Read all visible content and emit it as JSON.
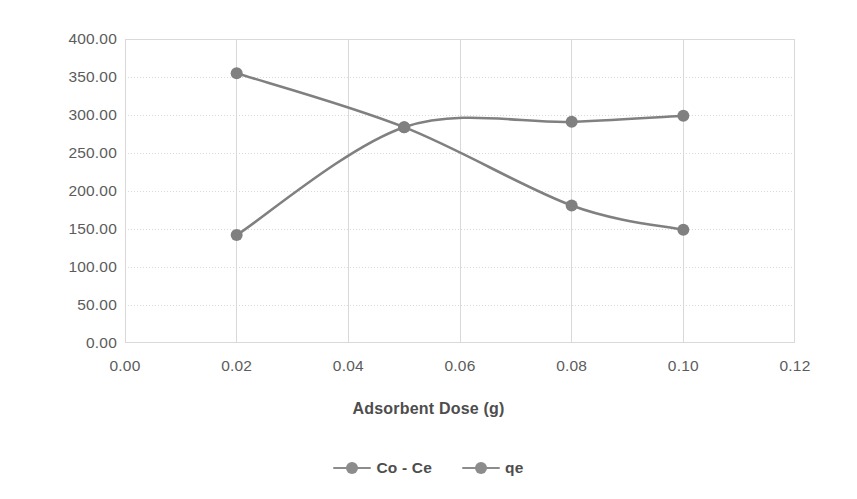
{
  "chart_data": {
    "type": "line",
    "title": "",
    "xlabel": "Adsorbent Dose (g)",
    "ylabel": "",
    "xlim": [
      0.0,
      0.12
    ],
    "ylim": [
      0.0,
      400.0
    ],
    "grid": true,
    "legend_position": "bottom",
    "x": [
      0.02,
      0.05,
      0.08,
      0.1
    ],
    "series": [
      {
        "name": "Co - Ce",
        "values": [
          355.0,
          284.0,
          181.0,
          149.0
        ],
        "color": "#808080"
      },
      {
        "name": "qe",
        "values": [
          142.0,
          284.0,
          291.0,
          299.0
        ],
        "color": "#808080"
      }
    ],
    "x_ticks": [
      "0.00",
      "0.02",
      "0.04",
      "0.06",
      "0.08",
      "0.10",
      "0.12"
    ],
    "x_tick_values": [
      0.0,
      0.02,
      0.04,
      0.06,
      0.08,
      0.1,
      0.12
    ],
    "y_ticks": [
      "0.00",
      "50.00",
      "100.00",
      "150.00",
      "200.00",
      "250.00",
      "300.00",
      "350.00",
      "400.00"
    ],
    "y_tick_values": [
      0,
      50,
      100,
      150,
      200,
      250,
      300,
      350,
      400
    ]
  },
  "axis": {
    "x_title": "Adsorbent Dose (g)"
  },
  "legend": {
    "items": [
      {
        "label": "Co - Ce"
      },
      {
        "label": "qe"
      }
    ]
  },
  "colors": {
    "series": "#808080",
    "grid": "#d9d9d9",
    "axis": "#d9d9d9",
    "text": "#5c5c5c",
    "background": "#ffffff"
  }
}
